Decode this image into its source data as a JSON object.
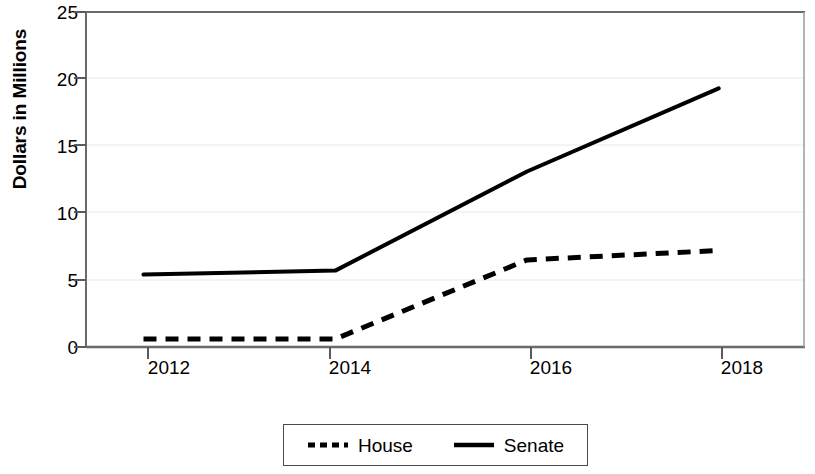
{
  "chart_data": {
    "type": "line",
    "title": "",
    "subtitle": "",
    "xlabel": "",
    "ylabel": "Dollars in Millions",
    "x": [
      2012,
      2014,
      2016,
      2018
    ],
    "xticklabels": [
      "2012",
      "2014",
      "2016",
      "2018"
    ],
    "yticklabels": [
      "0",
      "5",
      "10",
      "15",
      "20",
      "25"
    ],
    "yticks": [
      0,
      5,
      10,
      15,
      20,
      25
    ],
    "xlim": [
      2011.4,
      2018.9
    ],
    "ylim": [
      0,
      25
    ],
    "grid": true,
    "grid_axis": "y",
    "legend_position": "below-center",
    "series": [
      {
        "name": "House",
        "style": "dashed",
        "color": "#000000",
        "values": [
          0.6,
          0.6,
          6.5,
          7.2
        ]
      },
      {
        "name": "Senate",
        "style": "solid",
        "color": "#000000",
        "values": [
          5.4,
          5.7,
          13.1,
          19.3
        ]
      }
    ]
  },
  "axes": {
    "y_title": "Dollars in Millions",
    "y_ticks": [
      {
        "label": "25",
        "value": 25
      },
      {
        "label": "20",
        "value": 20
      },
      {
        "label": "15",
        "value": 15
      },
      {
        "label": "10",
        "value": 10
      },
      {
        "label": "5",
        "value": 5
      },
      {
        "label": "0",
        "value": 0
      }
    ],
    "x_ticks": [
      {
        "label": "2012",
        "value": 2012
      },
      {
        "label": "2014",
        "value": 2014
      },
      {
        "label": "2016",
        "value": 2016
      },
      {
        "label": "2018",
        "value": 2018
      }
    ]
  },
  "legend": {
    "entries": [
      {
        "label": "House",
        "style": "dashed"
      },
      {
        "label": "Senate",
        "style": "solid"
      }
    ]
  },
  "colors": {
    "line": "#000000",
    "axis": "#5a5a5a",
    "grid": "#e8e8e8",
    "background": "#ffffff"
  }
}
